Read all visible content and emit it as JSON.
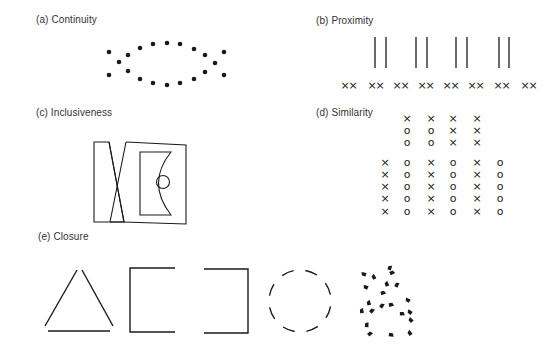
{
  "panels": {
    "a": {
      "label": "(a) Continuity"
    },
    "b": {
      "label": "(b) Proximity"
    },
    "c": {
      "label": "(c) Inclusiveness"
    },
    "d": {
      "label": "(d) Similarity"
    },
    "e": {
      "label": "(e) Closure"
    }
  },
  "continuity_dots": [
    [
      109,
      52
    ],
    [
      128,
      55
    ],
    [
      140,
      48
    ],
    [
      153,
      44
    ],
    [
      167,
      43
    ],
    [
      180,
      44
    ],
    [
      194,
      49
    ],
    [
      205,
      55
    ],
    [
      224,
      52
    ],
    [
      119,
      62
    ],
    [
      215,
      63
    ],
    [
      109,
      75
    ],
    [
      128,
      71
    ],
    [
      140,
      79
    ],
    [
      153,
      83
    ],
    [
      167,
      85
    ],
    [
      180,
      83
    ],
    [
      194,
      79
    ],
    [
      205,
      72
    ],
    [
      224,
      75
    ]
  ],
  "proximity": {
    "line_pairs": [
      [
        375,
        386
      ],
      [
        416,
        427
      ],
      [
        456,
        467
      ],
      [
        499,
        509
      ]
    ],
    "line_y": [
      37,
      68
    ],
    "xx_pairs_x": [
      341,
      368,
      393,
      418,
      443,
      468,
      494,
      521
    ],
    "xx_y": 85,
    "xx_glyph": "×"
  },
  "similarity": {
    "top_block": {
      "cols": [
        407,
        431,
        453,
        477
      ],
      "rows_y": [
        118,
        130,
        142
      ],
      "rows": [
        [
          "x",
          "x",
          "x",
          "x"
        ],
        [
          "o",
          "o",
          "x",
          "x"
        ],
        [
          "o",
          "o",
          "x",
          "x"
        ]
      ]
    },
    "bottom_block": {
      "cols": [
        385,
        407,
        431,
        453,
        477,
        500
      ],
      "rows_y": [
        162,
        174,
        186,
        198,
        211
      ],
      "rows": [
        [
          "x",
          "o",
          "x",
          "o",
          "x",
          "o"
        ],
        [
          "x",
          "o",
          "x",
          "o",
          "x",
          "o"
        ],
        [
          "x",
          "o",
          "x",
          "o",
          "x",
          "o"
        ],
        [
          "x",
          "o",
          "x",
          "o",
          "x",
          "o"
        ],
        [
          "x",
          "o",
          "x",
          "o",
          "x",
          "o"
        ]
      ]
    },
    "glyphs": {
      "x": "×",
      "o": "o"
    }
  },
  "closure_blobs": [
    [
      364,
      274
    ],
    [
      374,
      277
    ],
    [
      390,
      268
    ],
    [
      392,
      273
    ],
    [
      366,
      287
    ],
    [
      387,
      284
    ],
    [
      397,
      285
    ],
    [
      383,
      293
    ],
    [
      408,
      300
    ],
    [
      369,
      303
    ],
    [
      382,
      306
    ],
    [
      391,
      305
    ],
    [
      410,
      312
    ],
    [
      362,
      311
    ],
    [
      372,
      311
    ],
    [
      402,
      314
    ],
    [
      411,
      320
    ],
    [
      367,
      325
    ],
    [
      370,
      334
    ],
    [
      391,
      335
    ],
    [
      410,
      333
    ]
  ],
  "colors": {
    "ink": "#1a1a1a",
    "label": "#333333",
    "background": "#ffffff"
  }
}
